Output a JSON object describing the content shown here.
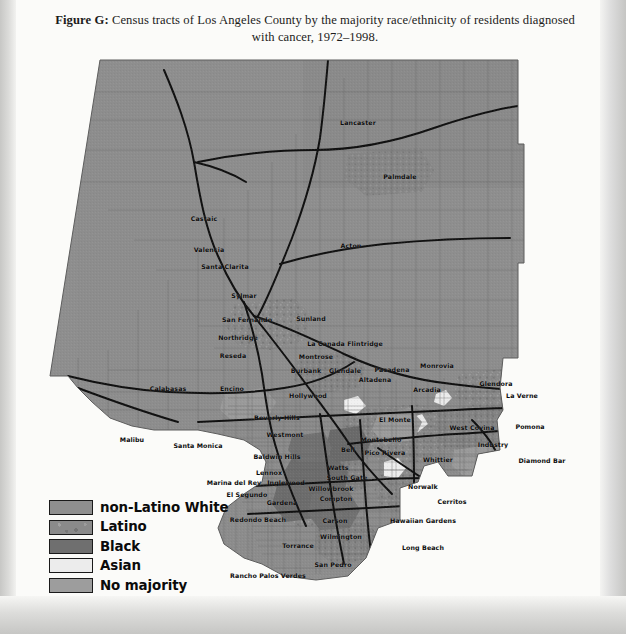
{
  "caption": {
    "figure_label": "Figure G:",
    "text": " Census tracts of Los Angeles County by the majority race/ethnicity of residents diagnosed with cancer, 1972–1998."
  },
  "legend": {
    "items": [
      {
        "label": "non-Latino White",
        "color": "#8f8f8f",
        "pattern": "solid"
      },
      {
        "label": "Latino",
        "color": "#8a8a8a",
        "pattern": "mottled"
      },
      {
        "label": "Black",
        "color": "#6f6f6f",
        "pattern": "solid"
      },
      {
        "label": "Asian",
        "color": "#ececec",
        "pattern": "solid"
      },
      {
        "label": "No majority",
        "color": "#9d9d9d",
        "pattern": "solid"
      }
    ]
  },
  "map": {
    "title": "Los Angeles County census tracts",
    "base_fill": "#8c8c8c",
    "ocean_fill": "#fbfbf9",
    "tract_line": "#6d6d6d",
    "freeway_line": "#111111",
    "cities": [
      {
        "name": "Lancaster",
        "x": 310,
        "y": 64
      },
      {
        "name": "Palmdale",
        "x": 352,
        "y": 118
      },
      {
        "name": "Castaic",
        "x": 156,
        "y": 160
      },
      {
        "name": "Valencia",
        "x": 161,
        "y": 191
      },
      {
        "name": "Santa Clarita",
        "x": 177,
        "y": 208
      },
      {
        "name": "Acton",
        "x": 303,
        "y": 187
      },
      {
        "name": "Sylmar",
        "x": 196,
        "y": 237
      },
      {
        "name": "San Fernando",
        "x": 199,
        "y": 261
      },
      {
        "name": "Sunland",
        "x": 263,
        "y": 260
      },
      {
        "name": "Northridge",
        "x": 190,
        "y": 279
      },
      {
        "name": "La Canada Flintridge",
        "x": 297,
        "y": 285
      },
      {
        "name": "Reseda",
        "x": 185,
        "y": 297
      },
      {
        "name": "Montrose",
        "x": 268,
        "y": 298
      },
      {
        "name": "Burbank",
        "x": 258,
        "y": 312
      },
      {
        "name": "Glendale",
        "x": 297,
        "y": 312
      },
      {
        "name": "Pasadena",
        "x": 344,
        "y": 311
      },
      {
        "name": "Monrovia",
        "x": 389,
        "y": 307
      },
      {
        "name": "Altadena",
        "x": 327,
        "y": 321
      },
      {
        "name": "Glendora",
        "x": 448,
        "y": 325
      },
      {
        "name": "Calabasas",
        "x": 120,
        "y": 330
      },
      {
        "name": "Encino",
        "x": 184,
        "y": 330
      },
      {
        "name": "Arcadia",
        "x": 379,
        "y": 331
      },
      {
        "name": "La Verne",
        "x": 474,
        "y": 337
      },
      {
        "name": "Hollywood",
        "x": 260,
        "y": 337
      },
      {
        "name": "Beverly Hills",
        "x": 229,
        "y": 359
      },
      {
        "name": "El Monte",
        "x": 347,
        "y": 361
      },
      {
        "name": "West Covina",
        "x": 424,
        "y": 369
      },
      {
        "name": "Pomona",
        "x": 482,
        "y": 368
      },
      {
        "name": "Malibu",
        "x": 84,
        "y": 381
      },
      {
        "name": "Westmont",
        "x": 237,
        "y": 376
      },
      {
        "name": "Santa Monica",
        "x": 150,
        "y": 387
      },
      {
        "name": "Montebello",
        "x": 333,
        "y": 381
      },
      {
        "name": "Industry",
        "x": 445,
        "y": 386
      },
      {
        "name": "Baldwin Hills",
        "x": 229,
        "y": 398
      },
      {
        "name": "Pico Rivera",
        "x": 337,
        "y": 394
      },
      {
        "name": "Whittier",
        "x": 390,
        "y": 401
      },
      {
        "name": "Diamond Bar",
        "x": 494,
        "y": 402
      },
      {
        "name": "Bell",
        "x": 300,
        "y": 391
      },
      {
        "name": "Lennox",
        "x": 221,
        "y": 414
      },
      {
        "name": "Watts",
        "x": 290,
        "y": 409
      },
      {
        "name": "Marina del Rey",
        "x": 186,
        "y": 424
      },
      {
        "name": "Inglewood",
        "x": 238,
        "y": 424
      },
      {
        "name": "South Gate",
        "x": 299,
        "y": 419
      },
      {
        "name": "El Segundo",
        "x": 199,
        "y": 436
      },
      {
        "name": "Willowbrook",
        "x": 283,
        "y": 430
      },
      {
        "name": "Norwalk",
        "x": 375,
        "y": 428
      },
      {
        "name": "Compton",
        "x": 288,
        "y": 440
      },
      {
        "name": "Gardena",
        "x": 234,
        "y": 444
      },
      {
        "name": "Cerritos",
        "x": 404,
        "y": 443
      },
      {
        "name": "Redondo Beach",
        "x": 210,
        "y": 461
      },
      {
        "name": "Carson",
        "x": 287,
        "y": 462
      },
      {
        "name": "Hawaiian Gardens",
        "x": 375,
        "y": 462
      },
      {
        "name": "Wilmington",
        "x": 293,
        "y": 478
      },
      {
        "name": "Torrance",
        "x": 250,
        "y": 487
      },
      {
        "name": "Long Beach",
        "x": 375,
        "y": 489
      },
      {
        "name": "San Pedro",
        "x": 285,
        "y": 506
      },
      {
        "name": "Rancho Palos Verdes",
        "x": 220,
        "y": 517
      }
    ]
  }
}
